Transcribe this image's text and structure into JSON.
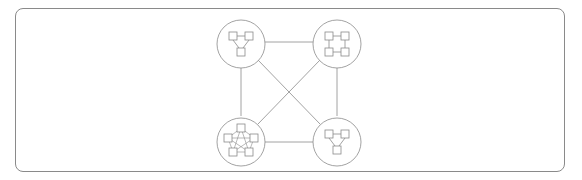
{
  "diagram": {
    "title": "",
    "type": "network-of-subnetworks",
    "colors": {
      "stroke": "#8a8a8a",
      "background": "#ffffff"
    },
    "clusters": [
      {
        "id": "top-left",
        "topology": "triangle",
        "node_count": 3
      },
      {
        "id": "top-right",
        "topology": "ring-square",
        "node_count": 4
      },
      {
        "id": "bottom-left",
        "topology": "full-mesh-pentagon",
        "node_count": 5
      },
      {
        "id": "bottom-right",
        "topology": "triangle",
        "node_count": 3
      }
    ],
    "links": [
      [
        "top-left",
        "top-right"
      ],
      [
        "top-left",
        "bottom-left"
      ],
      [
        "top-left",
        "bottom-right"
      ],
      [
        "top-right",
        "bottom-right"
      ],
      [
        "top-right",
        "bottom-left"
      ],
      [
        "bottom-left",
        "bottom-right"
      ]
    ]
  }
}
